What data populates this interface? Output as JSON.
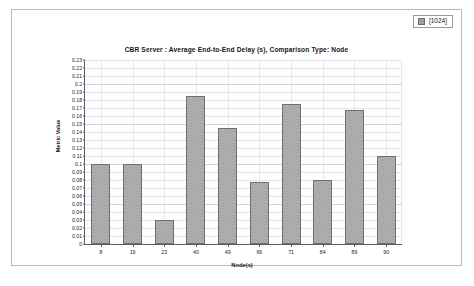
{
  "legend": {
    "swatch_name": "legend-swatch",
    "label": "[1024]",
    "color": "#9e9e9e"
  },
  "chart_data": {
    "type": "bar",
    "title": "CBR Server :  Average End-to-End Delay (s), Comparison Type: Node",
    "xlabel": "Node(s)",
    "ylabel": "Metric Value",
    "categories": [
      "8",
      "19",
      "23",
      "40",
      "49",
      "66",
      "71",
      "84",
      "89",
      "90"
    ],
    "values": [
      0.1,
      0.1,
      0.03,
      0.185,
      0.145,
      0.0775,
      0.175,
      0.08,
      0.167,
      0.11
    ],
    "series": [
      {
        "name": "[1024]",
        "values": [
          0.1,
          0.1,
          0.03,
          0.185,
          0.145,
          0.0775,
          0.175,
          0.08,
          0.167,
          0.11
        ]
      }
    ],
    "ylim": [
      0,
      0.23
    ],
    "ytick_step": 0.01,
    "ytick_labels": [
      "0.23",
      "0.22",
      "0.21",
      "0.2",
      "0.19",
      "0.18",
      "0.17",
      "0.16",
      "0.15",
      "0.14",
      "0.13",
      "0.12",
      "0.11",
      "0.1",
      "0.09",
      "0.08",
      "0.07",
      "0.06",
      "0.05",
      "0.04",
      "0.03",
      "0.02",
      "0.01",
      "0"
    ],
    "grid": true,
    "legend_position": "top-right",
    "bar_color": "#9d9d9d",
    "bar_edge_color": "#6f6f6f"
  }
}
